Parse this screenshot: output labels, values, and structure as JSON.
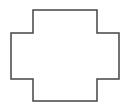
{
  "diagram": {
    "shape": "cross-polygon",
    "stroke_color": "#444444",
    "fill_color": "#ffffff",
    "stroke_width": 1.5,
    "points": [
      [
        33,
        10
      ],
      [
        97,
        10
      ],
      [
        97,
        33
      ],
      [
        119,
        33
      ],
      [
        119,
        79
      ],
      [
        97,
        79
      ],
      [
        97,
        101
      ],
      [
        33,
        101
      ],
      [
        33,
        79
      ],
      [
        11,
        79
      ],
      [
        11,
        33
      ],
      [
        33,
        33
      ]
    ]
  }
}
